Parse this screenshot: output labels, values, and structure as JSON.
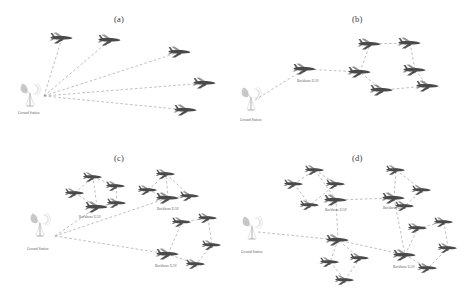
{
  "figure": {
    "background": "#ffffff",
    "link_color": "#8a8a8a",
    "plane_body_color": "#4a4a4a",
    "plane_wing_color": "#6e6e6e",
    "station_color": "#b5b5b5",
    "label_color": "#5a5a5a",
    "panel_label_color": "#3a3a3a"
  },
  "labels": {
    "ground_station": "Ground Station",
    "backbone_uav": "Backbone UAV"
  },
  "panels": [
    {
      "id": "a",
      "label": "(a)",
      "label_pos": [
        114,
        14
      ],
      "topology": "star",
      "description": "Ground station directly linked to five UAVs",
      "station": {
        "name": "ground-station",
        "pos": [
          30,
          95
        ],
        "label_pos": [
          18,
          111
        ]
      },
      "hub": [
        44,
        96
      ],
      "planes": [
        {
          "pos": [
            62,
            38
          ],
          "scale": 1.0
        },
        {
          "pos": [
            110,
            40
          ],
          "scale": 1.0
        },
        {
          "pos": [
            180,
            52
          ],
          "scale": 1.0
        },
        {
          "pos": [
            205,
            83
          ],
          "scale": 1.0
        },
        {
          "pos": [
            186,
            110
          ],
          "scale": 1.0
        }
      ],
      "links": [
        [
          [
            44,
            96
          ],
          [
            62,
            38
          ]
        ],
        [
          [
            44,
            96
          ],
          [
            110,
            40
          ]
        ],
        [
          [
            44,
            96
          ],
          [
            180,
            52
          ]
        ],
        [
          [
            44,
            96
          ],
          [
            205,
            83
          ]
        ],
        [
          [
            44,
            96
          ],
          [
            186,
            110
          ]
        ]
      ]
    },
    {
      "id": "b",
      "label": "(b)",
      "label_pos": [
        352,
        14
      ],
      "topology": "single-backbone",
      "description": "Ground station to one backbone UAV leading a six-UAV cluster",
      "station": {
        "name": "ground-station",
        "pos": [
          251,
          99
        ],
        "label_pos": [
          240,
          118
        ]
      },
      "hub": [
        255,
        100
      ],
      "backbones": [
        {
          "pos": [
            305,
            69
          ],
          "label_pos": [
            297,
            79
          ]
        }
      ],
      "planes": [
        {
          "pos": [
            370,
            44
          ],
          "scale": 1.0
        },
        {
          "pos": [
            410,
            43
          ],
          "scale": 1.0
        },
        {
          "pos": [
            360,
            72
          ],
          "scale": 1.0
        },
        {
          "pos": [
            415,
            70
          ],
          "scale": 1.0
        },
        {
          "pos": [
            382,
            90
          ],
          "scale": 1.0
        },
        {
          "pos": [
            428,
            86
          ],
          "scale": 1.0
        }
      ],
      "links": [
        [
          [
            255,
            100
          ],
          [
            305,
            69
          ]
        ],
        [
          [
            305,
            69
          ],
          [
            360,
            72
          ]
        ],
        [
          [
            360,
            72
          ],
          [
            370,
            44
          ]
        ],
        [
          [
            370,
            44
          ],
          [
            410,
            43
          ]
        ],
        [
          [
            410,
            43
          ],
          [
            415,
            70
          ]
        ],
        [
          [
            415,
            70
          ],
          [
            428,
            86
          ]
        ],
        [
          [
            428,
            86
          ],
          [
            382,
            90
          ]
        ],
        [
          [
            382,
            90
          ],
          [
            360,
            72
          ]
        ]
      ]
    },
    {
      "id": "c",
      "label": "(c)",
      "label_pos": [
        114,
        153
      ],
      "topology": "three-backbone",
      "description": "Ground station connected to three backbone UAVs each heading a cluster",
      "station": {
        "name": "ground-station",
        "pos": [
          40,
          225
        ],
        "label_pos": [
          27,
          247
        ]
      },
      "hub": [
        55,
        236
      ],
      "backbones": [
        {
          "pos": [
            97,
            207
          ],
          "label_pos": [
            79,
            215
          ]
        },
        {
          "pos": [
            168,
            198
          ],
          "label_pos": [
            157,
            207
          ]
        },
        {
          "pos": [
            168,
            254
          ],
          "label_pos": [
            155,
            264
          ]
        }
      ],
      "planes": [
        {
          "pos": [
            93,
            177
          ],
          "scale": 0.85
        },
        {
          "pos": [
            75,
            193
          ],
          "scale": 0.85
        },
        {
          "pos": [
            116,
            186
          ],
          "scale": 0.85
        },
        {
          "pos": [
            117,
            203
          ],
          "scale": 0.85
        },
        {
          "pos": [
            166,
            174
          ],
          "scale": 0.85
        },
        {
          "pos": [
            148,
            190
          ],
          "scale": 0.85
        },
        {
          "pos": [
            190,
            196
          ],
          "scale": 0.85
        },
        {
          "pos": [
            182,
            222
          ],
          "scale": 0.85
        },
        {
          "pos": [
            208,
            218
          ],
          "scale": 0.85
        },
        {
          "pos": [
            212,
            245
          ],
          "scale": 0.85
        },
        {
          "pos": [
            196,
            264
          ],
          "scale": 0.85
        }
      ],
      "links": [
        [
          [
            55,
            236
          ],
          [
            97,
            207
          ]
        ],
        [
          [
            55,
            236
          ],
          [
            168,
            198
          ]
        ],
        [
          [
            55,
            236
          ],
          [
            168,
            254
          ]
        ],
        [
          [
            97,
            207
          ],
          [
            93,
            177
          ]
        ],
        [
          [
            93,
            177
          ],
          [
            116,
            186
          ]
        ],
        [
          [
            116,
            186
          ],
          [
            117,
            203
          ]
        ],
        [
          [
            117,
            203
          ],
          [
            97,
            207
          ]
        ],
        [
          [
            97,
            207
          ],
          [
            75,
            193
          ]
        ],
        [
          [
            75,
            193
          ],
          [
            93,
            177
          ]
        ],
        [
          [
            168,
            198
          ],
          [
            166,
            174
          ]
        ],
        [
          [
            166,
            174
          ],
          [
            190,
            196
          ]
        ],
        [
          [
            190,
            196
          ],
          [
            168,
            198
          ]
        ],
        [
          [
            168,
            198
          ],
          [
            148,
            190
          ]
        ],
        [
          [
            148,
            190
          ],
          [
            166,
            174
          ]
        ],
        [
          [
            168,
            254
          ],
          [
            182,
            222
          ]
        ],
        [
          [
            182,
            222
          ],
          [
            208,
            218
          ]
        ],
        [
          [
            208,
            218
          ],
          [
            212,
            245
          ]
        ],
        [
          [
            212,
            245
          ],
          [
            196,
            264
          ]
        ],
        [
          [
            196,
            264
          ],
          [
            168,
            254
          ]
        ]
      ]
    },
    {
      "id": "d",
      "label": "(d)",
      "label_pos": [
        352,
        153
      ],
      "topology": "mesh-backbone",
      "description": "Ground station to backbone UAVs which interconnect in a mesh",
      "station": {
        "name": "ground-station",
        "pos": [
          252,
          228
        ],
        "label_pos": [
          241,
          250
        ]
      },
      "hub": [
        258,
        232
      ],
      "backbones": [
        {
          "pos": [
            336,
            200
          ],
          "label_pos": [
            325,
            208
          ]
        },
        {
          "pos": [
            394,
            198
          ],
          "label_pos": [
            383,
            206
          ]
        },
        {
          "pos": [
            405,
            255
          ],
          "label_pos": [
            393,
            265
          ]
        },
        {
          "pos": [
            338,
            240
          ],
          "label_pos": null
        }
      ],
      "planes": [
        {
          "pos": [
            315,
            170
          ],
          "scale": 0.85
        },
        {
          "pos": [
            294,
            184
          ],
          "scale": 0.85
        },
        {
          "pos": [
            336,
            184
          ],
          "scale": 0.85
        },
        {
          "pos": [
            310,
            205
          ],
          "scale": 0.85
        },
        {
          "pos": [
            396,
            170
          ],
          "scale": 0.85
        },
        {
          "pos": [
            422,
            190
          ],
          "scale": 0.85
        },
        {
          "pos": [
            405,
            206
          ],
          "scale": 0.85
        },
        {
          "pos": [
            418,
            228
          ],
          "scale": 0.85
        },
        {
          "pos": [
            444,
            222
          ],
          "scale": 0.85
        },
        {
          "pos": [
            448,
            248
          ],
          "scale": 0.85
        },
        {
          "pos": [
            428,
            268
          ],
          "scale": 0.85
        },
        {
          "pos": [
            330,
            262
          ],
          "scale": 0.85
        },
        {
          "pos": [
            360,
            258
          ],
          "scale": 0.85
        },
        {
          "pos": [
            345,
            280
          ],
          "scale": 0.85
        }
      ],
      "links": [
        [
          [
            258,
            232
          ],
          [
            338,
            240
          ]
        ],
        [
          [
            338,
            240
          ],
          [
            336,
            200
          ]
        ],
        [
          [
            336,
            200
          ],
          [
            394,
            198
          ]
        ],
        [
          [
            394,
            198
          ],
          [
            405,
            255
          ]
        ],
        [
          [
            405,
            255
          ],
          [
            338,
            240
          ]
        ],
        [
          [
            336,
            200
          ],
          [
            315,
            170
          ]
        ],
        [
          [
            315,
            170
          ],
          [
            336,
            184
          ]
        ],
        [
          [
            336,
            184
          ],
          [
            310,
            205
          ]
        ],
        [
          [
            310,
            205
          ],
          [
            294,
            184
          ]
        ],
        [
          [
            294,
            184
          ],
          [
            315,
            170
          ]
        ],
        [
          [
            394,
            198
          ],
          [
            396,
            170
          ]
        ],
        [
          [
            396,
            170
          ],
          [
            422,
            190
          ]
        ],
        [
          [
            422,
            190
          ],
          [
            405,
            206
          ]
        ],
        [
          [
            405,
            206
          ],
          [
            394,
            198
          ]
        ],
        [
          [
            405,
            255
          ],
          [
            418,
            228
          ]
        ],
        [
          [
            418,
            228
          ],
          [
            444,
            222
          ]
        ],
        [
          [
            444,
            222
          ],
          [
            448,
            248
          ]
        ],
        [
          [
            448,
            248
          ],
          [
            428,
            268
          ]
        ],
        [
          [
            428,
            268
          ],
          [
            405,
            255
          ]
        ],
        [
          [
            338,
            240
          ],
          [
            330,
            262
          ]
        ],
        [
          [
            330,
            262
          ],
          [
            345,
            280
          ]
        ],
        [
          [
            345,
            280
          ],
          [
            360,
            258
          ]
        ],
        [
          [
            360,
            258
          ],
          [
            338,
            240
          ]
        ]
      ]
    }
  ]
}
